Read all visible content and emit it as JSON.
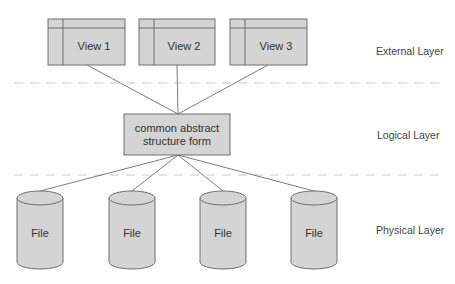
{
  "diagram": {
    "colors": {
      "node_fill": "#d4d4d4",
      "node_stroke": "#6e6e6e",
      "divider": "#c8c8c8",
      "text": "#333333"
    },
    "layers": [
      {
        "id": "external",
        "label": "External Layer"
      },
      {
        "id": "logical",
        "label": "Logical Layer"
      },
      {
        "id": "physical",
        "label": "Physical Layer"
      }
    ],
    "views": [
      {
        "label": "View 1"
      },
      {
        "label": "View 2"
      },
      {
        "label": "View 3"
      }
    ],
    "logical_node": {
      "line1": "common abstract",
      "line2": "structure form"
    },
    "files": [
      {
        "label": "File"
      },
      {
        "label": "File"
      },
      {
        "label": "File"
      },
      {
        "label": "File"
      }
    ]
  }
}
